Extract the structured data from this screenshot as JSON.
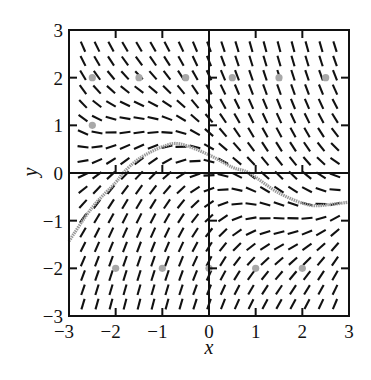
{
  "chart_data": {
    "type": "slope_field",
    "title": "",
    "xlabel": "x",
    "ylabel": "y",
    "xlim": [
      -3,
      3
    ],
    "ylim": [
      -3,
      3
    ],
    "xticks": [
      -3,
      -2,
      -1,
      0,
      1,
      2,
      3
    ],
    "yticks": [
      -3,
      -2,
      -1,
      0,
      1,
      2,
      3
    ],
    "xtick_labels": [
      "−3",
      "−2",
      "−1",
      "0",
      "1",
      "2",
      "3"
    ],
    "ytick_labels": [
      "−3",
      "−2",
      "−1",
      "0",
      "1",
      "2",
      "3"
    ],
    "grid": false,
    "axes_through_origin": true,
    "slope_field": {
      "equation": "dy/dx = -y - sin(x)",
      "x_start": -2.7,
      "x_end": 2.7,
      "x_step": 0.3,
      "y_start": -2.75,
      "y_end": 2.75,
      "y_step": 0.3,
      "segment_length_px": 11,
      "color": "#111111"
    },
    "solution_curve": {
      "points": [
        [
          -3,
          -1.43
        ],
        [
          -2.5,
          -0.72
        ],
        [
          -2,
          -0.2
        ],
        [
          -1.84,
          0
        ],
        [
          -1.5,
          0.3
        ],
        [
          -1,
          0.55
        ],
        [
          -0.62,
          0.61
        ],
        [
          0,
          0.38
        ],
        [
          0.5,
          0.12
        ],
        [
          0.86,
          0
        ],
        [
          1.5,
          -0.42
        ],
        [
          2.14,
          -0.67
        ],
        [
          2.6,
          -0.66
        ],
        [
          3,
          -0.61
        ]
      ],
      "color": "#9a9a9a"
    },
    "marked_points": [
      [
        -2.5,
        2
      ],
      [
        -1.5,
        2
      ],
      [
        -0.5,
        2
      ],
      [
        0.5,
        2
      ],
      [
        1.5,
        2
      ],
      [
        2.5,
        2
      ],
      [
        -2.5,
        1
      ],
      [
        -2,
        -2
      ],
      [
        -1,
        -2
      ],
      [
        0,
        -2
      ],
      [
        1,
        -2
      ],
      [
        2,
        -2
      ]
    ],
    "marked_point_color": "#a8a8a8"
  }
}
